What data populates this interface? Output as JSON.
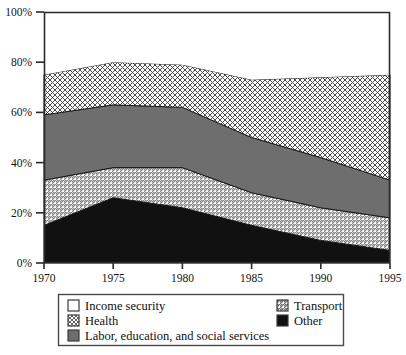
{
  "chart_data": {
    "type": "area",
    "stacked": true,
    "title": "",
    "subtitle": "",
    "xlabel": "",
    "ylabel": "",
    "x": [
      1970,
      1975,
      1980,
      1985,
      1990,
      1995
    ],
    "xtick_labels": [
      "1970",
      "1975",
      "1980",
      "1985",
      "1990",
      "1995"
    ],
    "ytick_labels": [
      "0%",
      "20%",
      "40%",
      "60%",
      "80%",
      "100%"
    ],
    "ytick_values": [
      0,
      20,
      40,
      60,
      80,
      100
    ],
    "xlim": [
      1970,
      1995
    ],
    "ylim": [
      0,
      100
    ],
    "grid": false,
    "legend_position": "bottom",
    "stack_order_bottom_to_top": [
      "Other",
      "Transport",
      "Labor, education, and social services",
      "Health",
      "Income security"
    ],
    "series": [
      {
        "name": "Other",
        "pattern": "solid-black",
        "color": "#111111",
        "values": [
          15,
          26,
          22,
          15,
          9,
          5
        ],
        "cumulative_top": [
          15,
          26,
          22,
          15,
          9,
          5
        ]
      },
      {
        "name": "Transport",
        "pattern": "diagonal-hatch",
        "color": "#d9d9d9",
        "values": [
          18,
          12,
          16,
          13,
          13,
          13
        ],
        "cumulative_top": [
          33,
          38,
          38,
          28,
          22,
          18
        ]
      },
      {
        "name": "Labor, education, and social services",
        "pattern": "solid-gray",
        "color": "#6e6e6e",
        "values": [
          26,
          25,
          24,
          22,
          20,
          15
        ],
        "cumulative_top": [
          59,
          63,
          62,
          50,
          42,
          33
        ]
      },
      {
        "name": "Health",
        "pattern": "cross-hatch",
        "color": "#e8e8e8",
        "values": [
          16,
          17,
          17,
          23,
          32,
          42
        ],
        "cumulative_top": [
          75,
          80,
          79,
          73,
          74,
          75
        ]
      },
      {
        "name": "Income security",
        "pattern": "solid-white",
        "color": "#ffffff",
        "values": [
          25,
          20,
          21,
          27,
          26,
          25
        ],
        "cumulative_top": [
          100,
          100,
          100,
          100,
          100,
          100
        ]
      }
    ]
  },
  "legend": {
    "column_left": [
      {
        "label": "Income security",
        "swatch": "solid-white"
      },
      {
        "label": "Health",
        "swatch": "cross-hatch"
      },
      {
        "label": "Labor, education, and social services",
        "swatch": "solid-gray"
      }
    ],
    "column_right": [
      {
        "label": "Transport",
        "swatch": "diagonal-hatch"
      },
      {
        "label": "Other",
        "swatch": "solid-black"
      }
    ]
  },
  "colors": {
    "axis": "#2a2a2a",
    "outline": "#1a1a1a",
    "other": "#111111",
    "transport": "#d9d9d9",
    "labor": "#6e6e6e",
    "health": "#e8e8e8",
    "income_security": "#ffffff",
    "legend_border": "#4a4a4a"
  }
}
